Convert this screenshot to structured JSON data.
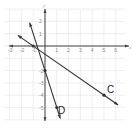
{
  "chart_data": {
    "type": "line",
    "title": "",
    "xlabel": "x",
    "ylabel": "y",
    "xlim": [
      -3.5,
      6.8
    ],
    "ylim": [
      -6,
      3
    ],
    "grid": true,
    "x_ticks": [
      -3,
      -2,
      -1,
      1,
      2,
      3,
      4,
      5,
      6
    ],
    "y_ticks": [
      2,
      1,
      -2,
      -3,
      -4,
      -5
    ],
    "series": [
      {
        "name": "C",
        "slope": -0.6667,
        "intercept": -0.6667,
        "points": [
          {
            "x": -1,
            "y": 0
          },
          {
            "x": 5,
            "y": -4
          }
        ],
        "extent": [
          -2.3,
          6.2
        ]
      },
      {
        "name": "D",
        "slope": -3,
        "intercept": -2,
        "points": [
          {
            "x": 0,
            "y": -2
          },
          {
            "x": 1,
            "y": -5
          }
        ],
        "extent": [
          -1.3,
          1.3
        ]
      }
    ],
    "annotations": [
      {
        "text": "C",
        "x": 5.4,
        "y": -3.6
      },
      {
        "text": "D",
        "x": 1.1,
        "y": -4.6
      }
    ]
  },
  "axes": {
    "x_label": "x",
    "y_label": "y"
  },
  "labels": {
    "line_c": "C",
    "line_d": "D"
  },
  "colors": {
    "line": "#333333",
    "axis": "#444444",
    "grid": "#e3e3e3"
  }
}
